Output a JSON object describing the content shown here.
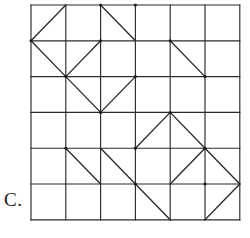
{
  "figure": {
    "label": "C.",
    "type": "square-grid-with-diagonals",
    "rows": 6,
    "cols": 6,
    "origin": {
      "x": 31,
      "y": 5
    },
    "cell_width": 34.8,
    "cell_height": 35.8,
    "stroke_color": "#2b2b2b",
    "background_color": "#ffffff",
    "diagonals": [
      {
        "row": 1,
        "col": 1,
        "dir": "/"
      },
      {
        "row": 1,
        "col": 3,
        "dir": "\\"
      },
      {
        "row": 2,
        "col": 1,
        "dir": "\\"
      },
      {
        "row": 2,
        "col": 2,
        "dir": "/"
      },
      {
        "row": 2,
        "col": 5,
        "dir": "\\"
      },
      {
        "row": 3,
        "col": 2,
        "dir": "\\"
      },
      {
        "row": 3,
        "col": 3,
        "dir": "/"
      },
      {
        "row": 4,
        "col": 4,
        "dir": "/"
      },
      {
        "row": 4,
        "col": 5,
        "dir": "\\"
      },
      {
        "row": 5,
        "col": 2,
        "dir": "\\"
      },
      {
        "row": 5,
        "col": 3,
        "dir": "\\"
      },
      {
        "row": 5,
        "col": 5,
        "dir": "/"
      },
      {
        "row": 5,
        "col": 6,
        "dir": "\\"
      },
      {
        "row": 6,
        "col": 4,
        "dir": "\\"
      },
      {
        "row": 6,
        "col": 6,
        "dir": "/"
      }
    ],
    "vertex_dots": [
      {
        "row": 1,
        "col": 3
      },
      {
        "row": 1,
        "col": 4
      },
      {
        "row": 2,
        "col": 1
      },
      {
        "row": 2,
        "col": 3
      },
      {
        "row": 2,
        "col": 5
      },
      {
        "row": 3,
        "col": 2
      },
      {
        "row": 3,
        "col": 4
      },
      {
        "row": 3,
        "col": 6
      },
      {
        "row": 4,
        "col": 3
      },
      {
        "row": 4,
        "col": 5
      },
      {
        "row": 5,
        "col": 2
      },
      {
        "row": 5,
        "col": 4
      },
      {
        "row": 5,
        "col": 6
      },
      {
        "row": 6,
        "col": 4
      },
      {
        "row": 6,
        "col": 6
      }
    ]
  }
}
